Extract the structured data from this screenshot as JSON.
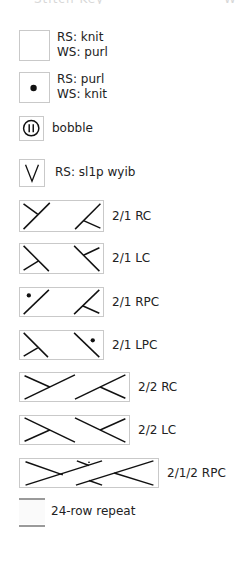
{
  "header": {
    "title_fragment": "Stitch Key",
    "right_fragment": "W"
  },
  "legend": {
    "items": [
      {
        "id": "knit",
        "symbol": "blank-square",
        "lines": [
          "RS: knit",
          "WS: purl"
        ]
      },
      {
        "id": "purl",
        "symbol": "dot-square",
        "lines": [
          "RS: purl",
          "WS: knit"
        ]
      },
      {
        "id": "bobble",
        "symbol": "bobble-circle",
        "lines": [
          "bobble"
        ]
      },
      {
        "id": "sl1p",
        "symbol": "v-slip",
        "lines": [
          "RS: sl1p wyib"
        ]
      },
      {
        "id": "21rc",
        "symbol": "cable-2-1-right",
        "lines": [
          "2/1 RC"
        ]
      },
      {
        "id": "21lc",
        "symbol": "cable-2-1-left",
        "lines": [
          "2/1 LC"
        ]
      },
      {
        "id": "21rpc",
        "symbol": "cable-2-1-right-purl",
        "lines": [
          "2/1 RPC"
        ]
      },
      {
        "id": "21lpc",
        "symbol": "cable-2-1-left-purl",
        "lines": [
          "2/1 LPC"
        ]
      },
      {
        "id": "22rc",
        "symbol": "cable-2-2-right",
        "lines": [
          "2/2 RC"
        ]
      },
      {
        "id": "22lc",
        "symbol": "cable-2-2-left",
        "lines": [
          "2/2 LC"
        ]
      },
      {
        "id": "212rpc",
        "symbol": "cable-2-1-2-right-purl",
        "lines": [
          "2/1/2 RPC"
        ]
      },
      {
        "id": "repeat",
        "symbol": "repeat-bracket",
        "lines": [
          "24-row repeat"
        ]
      }
    ]
  },
  "colors": {
    "symbol_border": "#c9c9c9",
    "stroke": "#111111",
    "repeat_line": "#9a9a9a"
  }
}
